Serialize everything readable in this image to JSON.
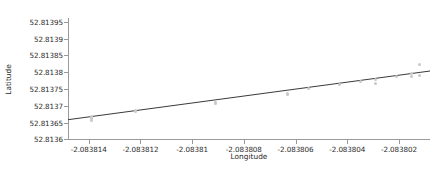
{
  "chart_data": {
    "type": "scatter",
    "title": "",
    "xlabel": "Longitude",
    "ylabel": "Latitude",
    "xlim": [
      -2.0838148,
      -2.0838008
    ],
    "ylim": [
      52.813598,
      52.8139615
    ],
    "xticks": [
      -2.083814,
      -2.083812,
      -2.08381,
      -2.083808,
      -2.083806,
      -2.083804,
      -2.083802
    ],
    "xticklabels": [
      "-2.083814",
      "-2.083812",
      "-2.08381",
      "-2.083808",
      "-2.083806",
      "-2.083804",
      "-2.083802"
    ],
    "yticks": [
      52.8136,
      52.81365,
      52.8137,
      52.81375,
      52.8138,
      52.81385,
      52.8139,
      52.81395
    ],
    "yticklabels": [
      "52.8136",
      "52.81365",
      "52.8137",
      "52.81375",
      "52.8138",
      "52.81385",
      "52.8139",
      "52.81395"
    ],
    "grid": false,
    "legend": null,
    "series": [
      {
        "name": "observations",
        "type": "scatter",
        "marker": "circle",
        "color": "#c9c9c9",
        "x": [
          -2.0838139,
          -2.0838139,
          -2.0838139,
          -2.0838139,
          -2.0838122,
          -2.0838122,
          -2.0838091,
          -2.0838091,
          -2.0838063,
          -2.0838063,
          -2.0838055,
          -2.0838043,
          -2.0838035,
          -2.0838029,
          -2.0838029,
          -2.0838021,
          -2.0838015,
          -2.0838015,
          -2.0838012,
          -2.0838012
        ],
        "y": [
          52.813668,
          52.813665,
          52.813661,
          52.813657,
          52.813686,
          52.813682,
          52.813709,
          52.813706,
          52.813738,
          52.813734,
          52.813751,
          52.813762,
          52.813773,
          52.813778,
          52.813767,
          52.813788,
          52.813797,
          52.813786,
          52.813822,
          52.81379
        ]
      },
      {
        "name": "linear fit",
        "type": "line",
        "color": "#3a3a3a",
        "x": [
          -2.0838148,
          -2.0838008
        ],
        "y": [
          52.8136585,
          52.8138035
        ]
      }
    ]
  },
  "figure": {
    "width": 446,
    "height": 176,
    "background": "#ffffff",
    "axis_color": "#9a9a9a",
    "text_color": "#2b2b2b",
    "line_color": "#3a3a3a",
    "marker_color": "#c9c9c9"
  }
}
